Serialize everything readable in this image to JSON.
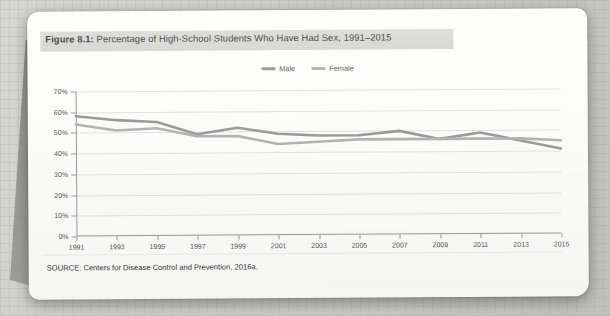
{
  "figure": {
    "caption_prefix": "Figure 8.1:",
    "caption_text": " Percentage of High-School Students Who Have Had Sex, 1991–2015",
    "source": "SOURCE: Centers for Disease Control and Prevention, 2016a."
  },
  "legend": {
    "position": "top-center",
    "items": [
      {
        "label": "Male",
        "color": "#9b9b9b"
      },
      {
        "label": "Female",
        "color": "#b4b4b4"
      }
    ]
  },
  "chart_data": {
    "type": "line",
    "title": "Percentage of High-School Students Who Have Had Sex, 1991–2015",
    "xlabel": "",
    "ylabel": "",
    "grid": true,
    "legend_position": "top-center",
    "x": [
      1991,
      1993,
      1995,
      1997,
      1999,
      2001,
      2003,
      2005,
      2007,
      2009,
      2011,
      2013,
      2015
    ],
    "xtick_labels": [
      "1991",
      "1993",
      "1995",
      "1997",
      "1999",
      "2001",
      "2003",
      "2005",
      "2007",
      "2009",
      "2011",
      "2013",
      "2015"
    ],
    "xlim": [
      1991,
      2015
    ],
    "ylim": [
      0,
      70
    ],
    "ytick_labels": [
      "0%",
      "10%",
      "20%",
      "30%",
      "40%",
      "50%",
      "60%",
      "70%"
    ],
    "ytick_values": [
      0,
      10,
      20,
      30,
      40,
      50,
      60,
      70
    ],
    "series": [
      {
        "name": "Male",
        "color": "#9b9b9b",
        "values": [
          58,
          56,
          55,
          49,
          52,
          49,
          48,
          48,
          50,
          46,
          49,
          45,
          41
        ]
      },
      {
        "name": "Female",
        "color": "#b4b4b4",
        "values": [
          54,
          51,
          52,
          48,
          48,
          44,
          45,
          46,
          46,
          46,
          46,
          46,
          45
        ]
      }
    ]
  }
}
